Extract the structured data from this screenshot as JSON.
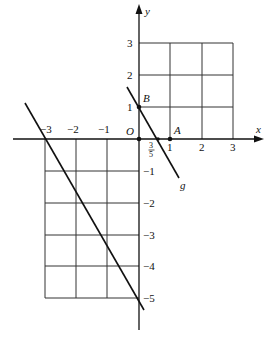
{
  "diagram": {
    "type": "coordinate-plane",
    "axes": {
      "x_label": "x",
      "y_label": "y",
      "origin_label": "O",
      "x_ticks": [
        "−3",
        "−2",
        "−1",
        "1",
        "2",
        "3"
      ],
      "y_ticks_positive": [
        "3",
        "2",
        "1"
      ],
      "y_ticks_negative": [
        "−1",
        "−2",
        "−3",
        "−4",
        "−5"
      ]
    },
    "points": {
      "A": {
        "label": "A",
        "coords": [
          1,
          0
        ]
      },
      "B": {
        "label": "B",
        "coords": [
          0,
          1
        ]
      },
      "O": {
        "label": "O",
        "coords": [
          0,
          0
        ]
      }
    },
    "lines": [
      {
        "name": "g",
        "label": "g",
        "passes_through": [
          [
            0,
            1
          ],
          [
            0.6,
            0
          ]
        ]
      },
      {
        "name": "unlabeled",
        "label": "",
        "passes_through": [
          [
            -3,
            0
          ],
          [
            0,
            -5
          ]
        ]
      }
    ],
    "fraction_label": {
      "numerator": "3",
      "denominator": "5"
    },
    "grids": [
      {
        "region": "first quadrant",
        "x_range": [
          0,
          3
        ],
        "y_range": [
          0,
          3
        ]
      },
      {
        "region": "third quadrant",
        "x_range": [
          -3,
          0
        ],
        "y_range": [
          -5,
          0
        ]
      }
    ]
  }
}
